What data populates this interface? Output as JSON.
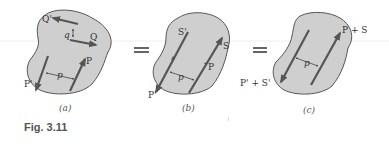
{
  "figure": {
    "caption": "Fig. 3.11",
    "colors": {
      "body_fill": "#cfcfcf",
      "body_stroke": "#555555",
      "arrow": "#555555",
      "text": "#333333"
    },
    "panels": [
      {
        "id": "a",
        "sublabel": "(a)",
        "labels": {
          "Q_prime": "Q'",
          "Q": "Q",
          "q": "q",
          "P_prime": "P'",
          "P": "P",
          "p": "p"
        }
      },
      {
        "id": "b",
        "sublabel": "(b)",
        "labels": {
          "S_prime": "S'",
          "S": "S",
          "P_prime": "P'",
          "P": "P",
          "p": "p"
        }
      },
      {
        "id": "c",
        "sublabel": "(c)",
        "labels": {
          "sum": "P + S",
          "sum_prime": "P' + S'",
          "p": "p"
        }
      }
    ],
    "operators": [
      "=",
      "="
    ]
  }
}
